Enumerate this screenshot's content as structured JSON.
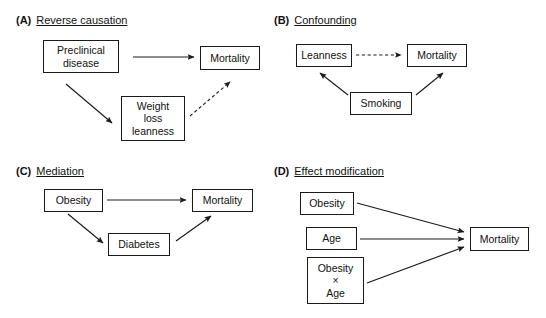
{
  "figure": {
    "caption_visible": false,
    "background_color": "#ffffff",
    "line_color": "#1a1a1a"
  },
  "panels": [
    {
      "id": "A",
      "letter": "(A)",
      "title": "Reverse causation",
      "nodes": [
        {
          "name": "preclinical-disease",
          "label": "Preclinical\ndisease"
        },
        {
          "name": "mortality",
          "label": "Mortality"
        },
        {
          "name": "weight-loss-leanness",
          "label": "Weight\nloss\nleanness"
        }
      ],
      "edges": [
        {
          "from": "Preclinical disease",
          "to": "Mortality",
          "style": "solid"
        },
        {
          "from": "Preclinical disease",
          "to": "Weight loss leanness",
          "style": "solid"
        },
        {
          "from": "Weight loss leanness",
          "to": "Mortality",
          "style": "dashed"
        }
      ]
    },
    {
      "id": "B",
      "letter": "(B)",
      "title": "Confounding",
      "nodes": [
        {
          "name": "leanness",
          "label": "Leanness"
        },
        {
          "name": "mortality",
          "label": "Mortality"
        },
        {
          "name": "smoking",
          "label": "Smoking"
        }
      ],
      "edges": [
        {
          "from": "Leanness",
          "to": "Mortality",
          "style": "dashed"
        },
        {
          "from": "Smoking",
          "to": "Leanness",
          "style": "solid"
        },
        {
          "from": "Smoking",
          "to": "Mortality",
          "style": "solid"
        }
      ]
    },
    {
      "id": "C",
      "letter": "(C)",
      "title": "Mediation",
      "nodes": [
        {
          "name": "obesity",
          "label": "Obesity"
        },
        {
          "name": "mortality",
          "label": "Mortality"
        },
        {
          "name": "diabetes",
          "label": "Diabetes"
        }
      ],
      "edges": [
        {
          "from": "Obesity",
          "to": "Mortality",
          "style": "solid"
        },
        {
          "from": "Obesity",
          "to": "Diabetes",
          "style": "solid"
        },
        {
          "from": "Diabetes",
          "to": "Mortality",
          "style": "solid"
        }
      ]
    },
    {
      "id": "D",
      "letter": "(D)",
      "title": "Effect modification",
      "nodes": [
        {
          "name": "obesity",
          "label": "Obesity"
        },
        {
          "name": "age",
          "label": "Age"
        },
        {
          "name": "obesity-x-age",
          "label": "Obesity\n×\nAge"
        },
        {
          "name": "mortality",
          "label": "Mortality"
        }
      ],
      "edges": [
        {
          "from": "Obesity",
          "to": "Mortality",
          "style": "solid"
        },
        {
          "from": "Age",
          "to": "Mortality",
          "style": "solid"
        },
        {
          "from": "Obesity × Age",
          "to": "Mortality",
          "style": "solid"
        }
      ]
    }
  ]
}
